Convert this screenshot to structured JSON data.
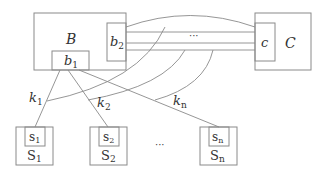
{
  "diagram": {
    "colors": {
      "stroke": "#8a8a8a",
      "text": "#333333",
      "background": "#ffffff"
    },
    "nodes": {
      "B": {
        "label": "B",
        "sub": ""
      },
      "b1": {
        "label": "b",
        "sub": "1"
      },
      "b2": {
        "label": "b",
        "sub": "2"
      },
      "C": {
        "label": "C",
        "sub": ""
      },
      "c": {
        "label": "c",
        "sub": ""
      },
      "S1": {
        "label": "S",
        "sub": "1"
      },
      "s1": {
        "label": "s",
        "sub": "1"
      },
      "S2": {
        "label": "S",
        "sub": "2"
      },
      "s2": {
        "label": "s",
        "sub": "2"
      },
      "Sn": {
        "label": "S",
        "sub": "n"
      },
      "sn": {
        "label": "s",
        "sub": "n"
      }
    },
    "edges": {
      "k1": {
        "label": "k",
        "sub": "1"
      },
      "k2": {
        "label": "k",
        "sub": "2"
      },
      "kn": {
        "label": "k",
        "sub": "n"
      }
    },
    "ellipsis_channels": "···",
    "ellipsis_servers": "···"
  }
}
